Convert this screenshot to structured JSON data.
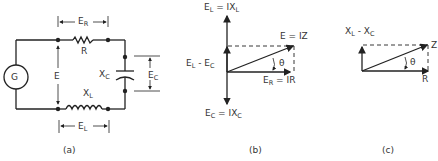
{
  "figure": {
    "panel_a": {
      "caption": "(a)",
      "generator": "G",
      "source_voltage": "E",
      "resistor": "R",
      "resistor_voltage": {
        "main": "E",
        "sub": "R"
      },
      "capacitor": {
        "main": "X",
        "sub": "C"
      },
      "capacitor_voltage": {
        "main": "E",
        "sub": "C"
      },
      "inductor": {
        "main": "X",
        "sub": "L"
      },
      "inductor_voltage": {
        "main": "E",
        "sub": "L"
      }
    },
    "panel_b": {
      "caption": "(b)",
      "top_label": {
        "a": "E",
        "a_sub": "L",
        "eq": " = IX",
        "b_sub": "L"
      },
      "mid_label": {
        "a": "E",
        "a_sub": "L",
        "eq": " - E",
        "b_sub": "C"
      },
      "bottom_label": {
        "a": "E",
        "a_sub": "C",
        "eq": " = IX",
        "b_sub": "C"
      },
      "resultant_label": "E = IZ",
      "horizontal_label": {
        "a": "E",
        "a_sub": "R",
        "eq": " = IR"
      },
      "angle": "θ"
    },
    "panel_c": {
      "caption": "(c)",
      "vertical_label": {
        "a": "X",
        "a_sub": "L",
        "eq": " - X",
        "b_sub": "C"
      },
      "resultant_label": "Z",
      "horizontal_label": "R",
      "angle": "θ"
    }
  }
}
